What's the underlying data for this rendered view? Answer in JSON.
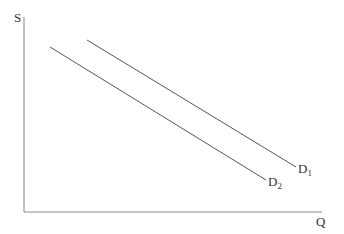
{
  "diagram": {
    "type": "supply-demand-shift",
    "y_axis_label": "S",
    "x_axis_label": "Q",
    "curves": [
      {
        "name": "D",
        "subscript": "1",
        "x1": 87,
        "y1": 40,
        "x2": 296,
        "y2": 167
      },
      {
        "name": "D",
        "subscript": "2",
        "x1": 50,
        "y1": 47,
        "x2": 266,
        "y2": 180
      }
    ],
    "axis_color": "#888888",
    "line_color": "#555555"
  }
}
